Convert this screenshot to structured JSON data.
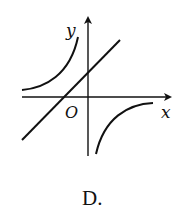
{
  "diagram": {
    "axes": {
      "x_label": "x",
      "y_label": "y",
      "origin_label": "O"
    },
    "caption": "D.",
    "curves": [
      {
        "name": "line",
        "type": "straight-line",
        "description": "increasing line with positive y-intercept and negative x-intercept"
      },
      {
        "name": "hyperbola-branch-upper-left",
        "type": "hyperbola",
        "quadrant": 2
      },
      {
        "name": "hyperbola-branch-lower-right",
        "type": "hyperbola",
        "quadrant": 4
      }
    ],
    "colors": {
      "stroke": "#111111",
      "background": "#ffffff"
    }
  }
}
